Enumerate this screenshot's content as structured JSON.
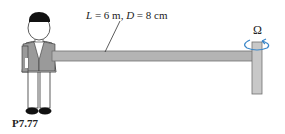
{
  "figure": {
    "id_label": "P7.77",
    "dimension_label": {
      "L_symbol": "L",
      "L_value": " = 6 m, ",
      "D_symbol": "D",
      "D_value": " = 8 cm"
    },
    "rotation_symbol": "Ω",
    "colors": {
      "rod": "#b4b4b4",
      "rod_edge": "#707070",
      "vest": "#9a9a9a",
      "hair_shoes": "#111111",
      "rotation_arrow": "#3a86c8"
    }
  }
}
